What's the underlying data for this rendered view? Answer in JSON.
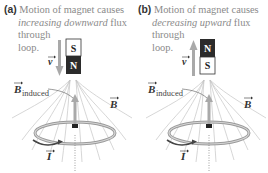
{
  "panels": [
    {
      "tag": "(a)",
      "caption_pre": "Motion of magnet causes",
      "caption_em": "increasing downward",
      "caption_post": " flux",
      "caption_line3": "through",
      "caption_line4": "loop.",
      "magnet_top": "S",
      "magnet_bottom": "N",
      "velocity_label": "v",
      "velocity_direction": "down",
      "b_induced_label": "B",
      "b_induced_sub": "induced",
      "b_label": "B",
      "current_label": "I"
    },
    {
      "tag": "(b)",
      "caption_pre": "Motion of magnet causes",
      "caption_em": "decreasing upward",
      "caption_post": " flux",
      "caption_line3": "through",
      "caption_line4": "loop.",
      "magnet_top": "N",
      "magnet_bottom": "S",
      "velocity_label": "v",
      "velocity_direction": "up",
      "b_induced_label": "B",
      "b_induced_sub": "induced",
      "b_label": "B",
      "current_label": "I"
    }
  ],
  "colors": {
    "magnet_dark": "#2b2b2b",
    "magnet_light": "#ffffff",
    "arrow_gray": "#a9a9a9",
    "loop_gray": "#9a9a9a",
    "field_line": "#c4c4c4",
    "text_gray": "#8a8a8a"
  }
}
